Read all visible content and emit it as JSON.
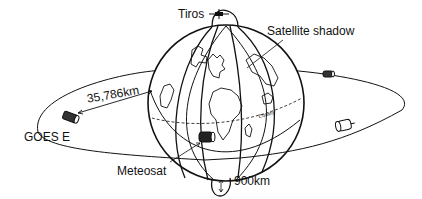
{
  "diagram": {
    "type": "satellite-orbit-illustration",
    "labels": {
      "polar_satellite": "Tiros",
      "satellite_shadow": "Satellite shadow",
      "geo_distance": "35,786km",
      "geo_satellite_west": "GOES E",
      "geo_satellite_center": "Meteosat",
      "polar_altitude": "900km",
      "equator": "Equator"
    },
    "colors": {
      "line": "#111111",
      "background": "#ffffff"
    }
  }
}
